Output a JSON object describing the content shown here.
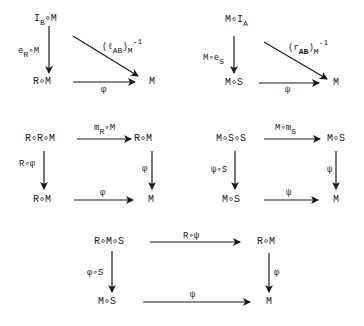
{
  "diagrams": [
    {
      "id": "left-unit",
      "nodes": {
        "top_left": {
          "main": "I",
          "sub": "B",
          "rest": "∘M"
        },
        "bottom_left": "R∘M",
        "bottom_right": "M"
      },
      "arrows": {
        "left_vertical": {
          "main": "e",
          "sub": "R",
          "rest": "∘M"
        },
        "diagonal": {
          "open": "(ℓ",
          "sub": "AB",
          "close": ")",
          "sub2": "M",
          "sup": "-1"
        },
        "bottom": "φ"
      }
    },
    {
      "id": "right-unit",
      "nodes": {
        "top_left": {
          "main": "M∘I",
          "sub": "A"
        },
        "bottom_left": "M∘S",
        "bottom_right": "M"
      },
      "arrows": {
        "left_vertical": {
          "main": "M∘e",
          "sub": "S"
        },
        "diagonal": {
          "open": "(r",
          "sub": "AB",
          "close": ")",
          "sub2": "M",
          "sup": "-1"
        },
        "bottom": "ψ"
      }
    },
    {
      "id": "left-associativity",
      "nodes": {
        "top_left": "R∘R∘M",
        "top_right": "R∘M",
        "bottom_left": "R∘M",
        "bottom_right": "M"
      },
      "arrows": {
        "top": {
          "main": "m",
          "sub": "R",
          "rest": "∘M"
        },
        "left_vertical": "R∘φ",
        "right_vertical": "φ",
        "bottom": "φ"
      }
    },
    {
      "id": "right-associativity",
      "nodes": {
        "top_left": "M∘S∘S",
        "top_right": "M∘S",
        "bottom_left": "M∘S",
        "bottom_right": "M"
      },
      "arrows": {
        "top": {
          "main": "M∘m",
          "sub": "S"
        },
        "left_vertical": "ψ∘S",
        "right_vertical": "ψ",
        "bottom": "ψ"
      }
    },
    {
      "id": "bimodule-compatibility",
      "nodes": {
        "top_left": "R∘M∘S",
        "top_right": "R∘M",
        "bottom_left": "M∘S",
        "bottom_right": "M"
      },
      "arrows": {
        "top": "R∘ψ",
        "left_vertical": "φ∘S",
        "right_vertical": "φ",
        "bottom": "ψ"
      }
    }
  ],
  "colors": {
    "ink": "#1a1a1a",
    "background": "#ffffff"
  }
}
